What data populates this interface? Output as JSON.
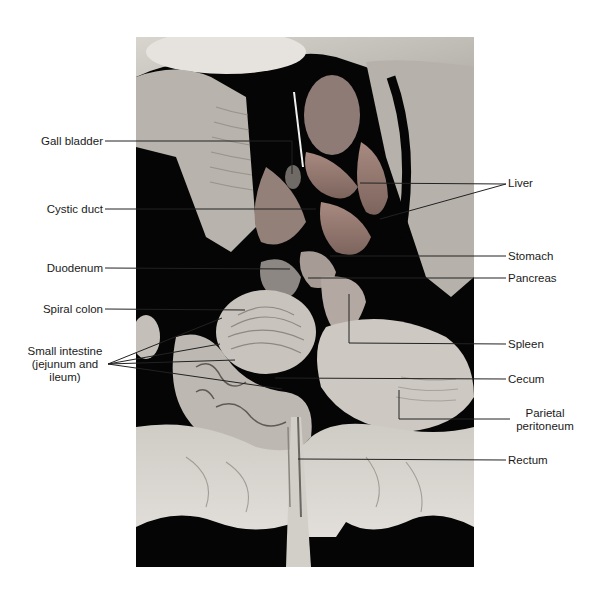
{
  "figure": {
    "photo_bg": "#050505",
    "tissue_color": "#c9c6c0",
    "organ_tint": "#9a7d74",
    "leader_color": "#222222"
  },
  "labels_left": [
    {
      "id": "gall-bladder",
      "text": "Gall bladder"
    },
    {
      "id": "cystic-duct",
      "text": "Cystic duct"
    },
    {
      "id": "duodenum",
      "text": "Duodenum"
    },
    {
      "id": "spiral-colon",
      "text": "Spiral colon"
    },
    {
      "id": "small-intestine",
      "line1": "Small intestine",
      "line2": "(jejunum and",
      "line3": "ileum)"
    }
  ],
  "labels_right": [
    {
      "id": "liver",
      "text": "Liver"
    },
    {
      "id": "stomach",
      "text": "Stomach"
    },
    {
      "id": "pancreas",
      "text": "Pancreas"
    },
    {
      "id": "spleen",
      "text": "Spleen"
    },
    {
      "id": "cecum",
      "text": "Cecum"
    },
    {
      "id": "parietal-peritoneum",
      "line1": "Parietal",
      "line2": "peritoneum"
    },
    {
      "id": "rectum",
      "text": "Rectum"
    }
  ]
}
